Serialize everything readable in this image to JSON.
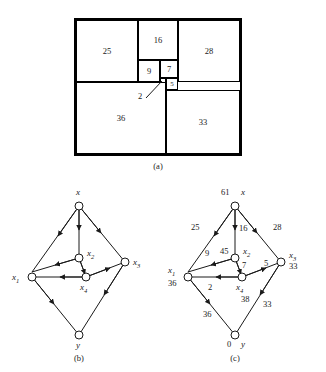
{
  "figure": {
    "panels": [
      {
        "id": "a",
        "caption": "(a)"
      },
      {
        "id": "b",
        "caption": "(b)"
      },
      {
        "id": "c",
        "caption": "(c)"
      }
    ]
  },
  "panel_a": {
    "caption": "(a)",
    "squares": [
      {
        "name": "square-25",
        "label": "25"
      },
      {
        "name": "square-16",
        "label": "16"
      },
      {
        "name": "square-28",
        "label": "28"
      },
      {
        "name": "square-9",
        "label": "9"
      },
      {
        "name": "square-7",
        "label": "7"
      },
      {
        "name": "square-5",
        "label": "5"
      },
      {
        "name": "square-2",
        "label": "2"
      },
      {
        "name": "square-36",
        "label": "36"
      },
      {
        "name": "square-33",
        "label": "33"
      }
    ],
    "pointer_label": "2"
  },
  "panel_b": {
    "caption": "(b)",
    "nodes": [
      {
        "id": "x",
        "label": "x",
        "sub": ""
      },
      {
        "id": "x1",
        "label": "x",
        "sub": "1"
      },
      {
        "id": "x2",
        "label": "x",
        "sub": "2"
      },
      {
        "id": "x3",
        "label": "x",
        "sub": "3"
      },
      {
        "id": "x4",
        "label": "x",
        "sub": "4"
      },
      {
        "id": "y",
        "label": "y",
        "sub": ""
      }
    ],
    "edges": [
      {
        "from": "x",
        "to": "x1"
      },
      {
        "from": "x",
        "to": "x2"
      },
      {
        "from": "x",
        "to": "x3"
      },
      {
        "from": "x2",
        "to": "x1"
      },
      {
        "from": "x2",
        "to": "x4"
      },
      {
        "from": "x4",
        "to": "x1"
      },
      {
        "from": "x4",
        "to": "x3"
      },
      {
        "from": "x1",
        "to": "y"
      },
      {
        "from": "x3",
        "to": "y"
      }
    ]
  },
  "panel_c": {
    "caption": "(c)",
    "nodes": [
      {
        "id": "x",
        "label": "x",
        "sub": "",
        "potential": "61"
      },
      {
        "id": "x1",
        "label": "x",
        "sub": "1",
        "potential": "36"
      },
      {
        "id": "x2",
        "label": "x",
        "sub": "2",
        "potential": "45"
      },
      {
        "id": "x3",
        "label": "x",
        "sub": "3",
        "potential": "33"
      },
      {
        "id": "x4",
        "label": "x",
        "sub": "4",
        "potential": "38"
      },
      {
        "id": "y",
        "label": "y",
        "sub": "",
        "potential": "0"
      }
    ],
    "edges": [
      {
        "from": "x",
        "to": "x1",
        "flow": "25"
      },
      {
        "from": "x",
        "to": "x2",
        "flow": "16"
      },
      {
        "from": "x",
        "to": "x3",
        "flow": "28"
      },
      {
        "from": "x2",
        "to": "x1",
        "flow": "9"
      },
      {
        "from": "x2",
        "to": "x4",
        "flow": "7"
      },
      {
        "from": "x4",
        "to": "x1",
        "flow": "2"
      },
      {
        "from": "x4",
        "to": "x3",
        "flow": "5"
      },
      {
        "from": "x1",
        "to": "y",
        "flow": "36"
      },
      {
        "from": "x3",
        "to": "y",
        "flow": "33"
      }
    ]
  }
}
